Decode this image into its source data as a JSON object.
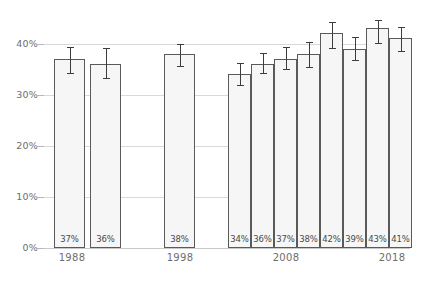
{
  "chart_data": {
    "type": "bar",
    "title": "",
    "subtitle": "",
    "xlabel": "",
    "ylabel": "",
    "ylim": [
      0,
      45
    ],
    "grid": true,
    "legend": null,
    "y_ticks": [
      0,
      10,
      20,
      30,
      40
    ],
    "y_tick_labels": [
      "0%",
      "10%",
      "20%",
      "30%",
      "40%"
    ],
    "x_tick_positions": [
      1988,
      1998,
      2008,
      2018
    ],
    "x_tick_labels": [
      "1988",
      "1998",
      "2008",
      "2018"
    ],
    "x": [
      1988,
      1990,
      1998,
      2007,
      2008,
      2009,
      2010,
      2011,
      2012,
      2014,
      2016
    ],
    "categories": [
      "1988",
      "1990",
      "1998",
      "2007",
      "2008",
      "2009",
      "2010",
      "2011",
      "2012",
      "2014",
      "2016"
    ],
    "values": [
      37,
      36,
      38,
      34,
      36,
      37,
      38,
      42,
      39,
      43,
      41
    ],
    "data_labels": [
      "37%",
      "36%",
      "38%",
      "34%",
      "36%",
      "37%",
      "38%",
      "42%",
      "39%",
      "43%",
      "41%"
    ],
    "error_bars": {
      "type": "symmetric-range",
      "lower": [
        34.3,
        33.3,
        35.6,
        31.8,
        34.2,
        35.1,
        35.4,
        39.2,
        36.8,
        40.1,
        38.5
      ],
      "upper": [
        39.4,
        39.1,
        40.0,
        36.2,
        38.1,
        39.3,
        40.3,
        44.3,
        41.3,
        44.6,
        43.3
      ]
    },
    "bars": [
      {
        "label": "37%",
        "value": 37,
        "err_low": 34.3,
        "err_high": 39.4,
        "left_px": 54,
        "width_px": 31
      },
      {
        "label": "36%",
        "value": 36,
        "err_low": 33.3,
        "err_high": 39.1,
        "left_px": 90,
        "width_px": 31
      },
      {
        "label": "38%",
        "value": 38,
        "err_low": 35.6,
        "err_high": 40.0,
        "left_px": 164,
        "width_px": 31
      },
      {
        "label": "34%",
        "value": 34,
        "err_low": 31.8,
        "err_high": 36.2,
        "left_px": 228,
        "width_px": 23
      },
      {
        "label": "36%",
        "value": 36,
        "err_low": 34.2,
        "err_high": 38.1,
        "left_px": 251,
        "width_px": 23
      },
      {
        "label": "37%",
        "value": 37,
        "err_low": 35.1,
        "err_high": 39.3,
        "left_px": 274,
        "width_px": 23
      },
      {
        "label": "38%",
        "value": 38,
        "err_low": 35.4,
        "err_high": 40.3,
        "left_px": 297,
        "width_px": 23
      },
      {
        "label": "42%",
        "value": 42,
        "err_low": 39.2,
        "err_high": 44.3,
        "left_px": 320,
        "width_px": 23
      },
      {
        "label": "39%",
        "value": 39,
        "err_low": 36.8,
        "err_high": 41.3,
        "left_px": 343,
        "width_px": 23
      },
      {
        "label": "43%",
        "value": 43,
        "err_low": 40.1,
        "err_high": 44.6,
        "left_px": 366,
        "width_px": 23
      },
      {
        "label": "41%",
        "value": 41,
        "err_low": 38.5,
        "err_high": 43.3,
        "left_px": 389,
        "width_px": 23
      }
    ],
    "x_axis_ticks": [
      {
        "label": "1988",
        "center_px": 72
      },
      {
        "label": "1998",
        "center_px": 180
      },
      {
        "label": "2008",
        "center_px": 286
      },
      {
        "label": "2018",
        "center_px": 392
      }
    ],
    "colors": {
      "bar_fill": "#f6f6f6",
      "bar_stroke": "#5a5a5a",
      "error_bar": "#3d3d3d",
      "gridline": "#d9d9d9",
      "tick_text": "#6e6e6e",
      "label_text": "#4a4a4a",
      "background": "#ffffff"
    }
  }
}
